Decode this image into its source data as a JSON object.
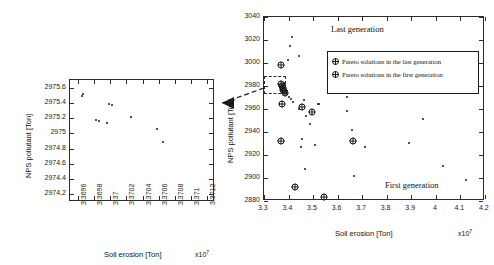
{
  "figure": {
    "multiplier_label": "x10",
    "multiplier_exp": "7"
  },
  "left_panel": {
    "y_axis_title": "NPS pollutant [Ton]",
    "x_axis_title": "Soil erosion [Ton]",
    "multiplier": "x10",
    "multiplier_exp": "7",
    "y_ticks": [
      "2975.6",
      "2975.4",
      "2975.2",
      "2975",
      "2974.8",
      "2974.6",
      "2974.4",
      "2974.2"
    ],
    "x_ticks": [
      "3.3696",
      "3.3698",
      "3.37",
      "3.3702",
      "3.3704",
      "3.3706",
      "3.3708",
      "3.371",
      "3.3712"
    ]
  },
  "right_panel": {
    "y_axis_title": "NPS pollutant [Ton]",
    "x_axis_title": "Soil erosion [Ton]",
    "multiplier": "x10",
    "multiplier_exp": "7",
    "y_ticks": [
      "3040",
      "3020",
      "3000",
      "2980",
      "2960",
      "2940",
      "2920",
      "2900",
      "2880"
    ],
    "x_ticks": [
      "3.3",
      "3.4",
      "3.5",
      "3.6",
      "3.7",
      "3.8",
      "3.9",
      "4",
      "4.1",
      "4.2"
    ],
    "annotation_last": "Last generation",
    "annotation_first": "First generation",
    "legend": [
      {
        "marker": "crossed-circle",
        "label": "Pareto solutions in the last generation"
      },
      {
        "marker": "crossed-circle",
        "label": "Pareto solutions in the first generation"
      }
    ]
  },
  "chart_data": [
    {
      "id": "left-inset",
      "type": "scatter",
      "title": "",
      "xlabel": "Soil erosion [Ton]",
      "ylabel": "NPS pollutant [Ton]",
      "x_multiplier": 10000000.0,
      "xlim": [
        3.3695,
        3.3713
      ],
      "ylim": [
        2974.1,
        2975.7
      ],
      "xticks": [
        3.3696,
        3.3698,
        3.37,
        3.3702,
        3.3704,
        3.3706,
        3.3708,
        3.371,
        3.3712
      ],
      "yticks": [
        2974.2,
        2974.4,
        2974.6,
        2974.8,
        2975,
        2975.2,
        2975.4,
        2975.6
      ],
      "grid": false,
      "legend": "none",
      "series": [
        {
          "name": "Pareto solutions in the last generation",
          "marker": "dot",
          "points": [
            {
              "x": 3.36965,
              "y": 2975.49
            },
            {
              "x": 3.36966,
              "y": 2975.51
            },
            {
              "x": 3.36982,
              "y": 2975.17
            },
            {
              "x": 3.36986,
              "y": 2975.16
            },
            {
              "x": 3.36996,
              "y": 2975.13
            },
            {
              "x": 3.36998,
              "y": 2975.38
            },
            {
              "x": 3.37002,
              "y": 2975.37
            },
            {
              "x": 3.37026,
              "y": 2975.22
            },
            {
              "x": 3.37058,
              "y": 2975.06
            },
            {
              "x": 3.37066,
              "y": 2974.89
            }
          ]
        }
      ]
    },
    {
      "id": "right-main",
      "type": "scatter",
      "title": "",
      "xlabel": "Soil erosion [Ton]",
      "ylabel": "NPS pollutant [Ton]",
      "x_multiplier": 10000000.0,
      "xlim": [
        3.3,
        4.2
      ],
      "ylim": [
        2880,
        3040
      ],
      "xticks": [
        3.3,
        3.4,
        3.5,
        3.6,
        3.7,
        3.8,
        3.9,
        4.0,
        4.1,
        4.2
      ],
      "yticks": [
        2880,
        2900,
        2920,
        2940,
        2960,
        2980,
        3000,
        3020,
        3040
      ],
      "grid": false,
      "legend": "inside-upper-right",
      "annotations": [
        {
          "text": "Last generation",
          "x": 3.68,
          "y": 3026
        },
        {
          "text": "First generation",
          "x": 3.79,
          "y": 2898
        }
      ],
      "series": [
        {
          "name": "Pareto solutions in the last generation",
          "marker": "crossed-circle",
          "points": [
            {
              "x": 3.368,
              "y": 2998.6
            },
            {
              "x": 3.371,
              "y": 2981.5
            },
            {
              "x": 3.374,
              "y": 2980.2
            },
            {
              "x": 3.376,
              "y": 2978.4
            },
            {
              "x": 3.379,
              "y": 2976.8
            },
            {
              "x": 3.382,
              "y": 2975.4
            },
            {
              "x": 3.384,
              "y": 2973.6
            }
          ]
        },
        {
          "name": "Pareto solutions in the first generation",
          "marker": "crossed-circle",
          "points": [
            {
              "x": 3.372,
              "y": 2964.2
            },
            {
              "x": 3.369,
              "y": 2932.2
            },
            {
              "x": 3.428,
              "y": 2892.6
            },
            {
              "x": 3.455,
              "y": 2962.0
            },
            {
              "x": 3.497,
              "y": 2957.2
            },
            {
              "x": 3.545,
              "y": 2883.2
            },
            {
              "x": 3.663,
              "y": 2932.3
            }
          ]
        },
        {
          "name": "Population (first generation)",
          "marker": "dot",
          "points": [
            {
              "x": 3.414,
              "y": 3022.6
            },
            {
              "x": 3.404,
              "y": 3014.6
            },
            {
              "x": 3.399,
              "y": 3003.0
            },
            {
              "x": 3.443,
              "y": 3006.2
            },
            {
              "x": 3.383,
              "y": 2982.6
            },
            {
              "x": 3.386,
              "y": 2980.6
            },
            {
              "x": 3.392,
              "y": 2976.0
            },
            {
              "x": 3.395,
              "y": 2972.8
            },
            {
              "x": 3.401,
              "y": 2970.5
            },
            {
              "x": 3.409,
              "y": 2968.8
            },
            {
              "x": 3.419,
              "y": 2966.4
            },
            {
              "x": 3.462,
              "y": 2967.8
            },
            {
              "x": 3.444,
              "y": 2960.4
            },
            {
              "x": 3.47,
              "y": 2954.2
            },
            {
              "x": 3.518,
              "y": 2964.6
            },
            {
              "x": 3.526,
              "y": 2964.6
            },
            {
              "x": 3.487,
              "y": 2947.2
            },
            {
              "x": 3.506,
              "y": 2929.0
            },
            {
              "x": 3.455,
              "y": 2933.6
            },
            {
              "x": 3.451,
              "y": 2927.0
            },
            {
              "x": 3.468,
              "y": 2908.2
            },
            {
              "x": 3.637,
              "y": 2958.2
            },
            {
              "x": 3.657,
              "y": 2942.0
            },
            {
              "x": 3.64,
              "y": 2970.6
            },
            {
              "x": 3.712,
              "y": 2926.8
            },
            {
              "x": 3.665,
              "y": 2901.4
            },
            {
              "x": 3.892,
              "y": 2930.8
            },
            {
              "x": 3.948,
              "y": 2951.6
            },
            {
              "x": 4.03,
              "y": 2910.2
            },
            {
              "x": 4.124,
              "y": 2898.0
            }
          ]
        }
      ]
    }
  ]
}
